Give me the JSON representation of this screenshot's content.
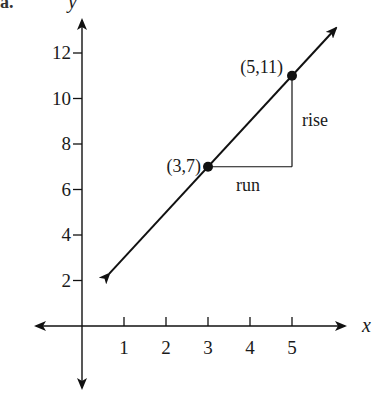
{
  "part_label": "a.",
  "chart_data": {
    "type": "line",
    "title": "",
    "xlabel": "x",
    "ylabel": "y",
    "x_ticks": [
      1,
      2,
      3,
      4,
      5
    ],
    "y_ticks": [
      2,
      4,
      6,
      8,
      10,
      12
    ],
    "xlim": [
      -1,
      6
    ],
    "ylim": [
      -1,
      13
    ],
    "grid": false,
    "line": {
      "slope": 2,
      "intercept": 1,
      "equation": "y = 2x + 1",
      "arrows": "both"
    },
    "points": [
      {
        "x": 3,
        "y": 7,
        "label": "(3,7)"
      },
      {
        "x": 5,
        "y": 11,
        "label": "(5,11)"
      }
    ],
    "annotations": [
      {
        "text": "run",
        "description": "horizontal segment from (3,7) to (5,7)"
      },
      {
        "text": "rise",
        "description": "vertical segment from (5,7) to (5,11)"
      }
    ]
  }
}
